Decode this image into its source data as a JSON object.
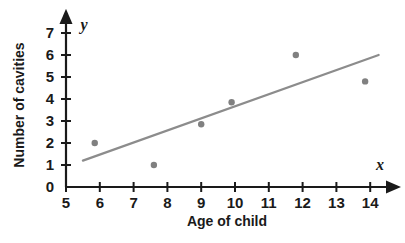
{
  "chart_data": {
    "type": "scatter",
    "title": "",
    "xlabel": "Age of child",
    "ylabel": "Number of cavities",
    "x_var_symbol": "x",
    "y_var_symbol": "y",
    "xlim": [
      5,
      14.6
    ],
    "ylim": [
      0,
      7.4
    ],
    "x_ticks": [
      5,
      6,
      7,
      8,
      9,
      10,
      11,
      12,
      13,
      14
    ],
    "y_ticks": [
      0,
      1,
      2,
      3,
      4,
      5,
      6,
      7
    ],
    "x_tick_labels": [
      "5",
      "6",
      "7",
      "8",
      "9",
      "10",
      "11",
      "12",
      "13",
      "14"
    ],
    "y_tick_labels": [
      "0",
      "1",
      "2",
      "3",
      "4",
      "5",
      "6",
      "7"
    ],
    "grid": false,
    "legend": false,
    "legend_position": "none",
    "points": [
      {
        "x": 5.85,
        "y": 2.0
      },
      {
        "x": 7.6,
        "y": 1.0
      },
      {
        "x": 9.0,
        "y": 2.85
      },
      {
        "x": 9.9,
        "y": 3.85
      },
      {
        "x": 11.8,
        "y": 6.0
      },
      {
        "x": 13.85,
        "y": 4.8
      }
    ],
    "trend_line": {
      "x_start": 5.5,
      "y_start": 1.2,
      "x_end": 14.25,
      "y_end": 6.0
    },
    "colors": {
      "point": "#808080",
      "trend_line": "#8c8c8c",
      "axis": "#1a1a1a",
      "background": "#ffffff"
    },
    "point_radius": 3.2,
    "trend_line_width": 2.2
  }
}
